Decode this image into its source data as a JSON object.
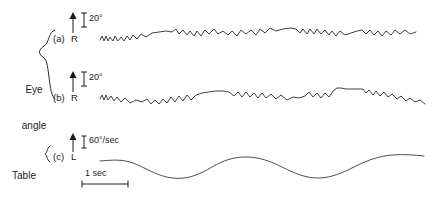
{
  "figure": {
    "background_color": "#ffffff",
    "ink_color": "#2b2b2b"
  },
  "groups": {
    "eye_angle_line1": "Eye",
    "eye_angle_line2": "angle",
    "table_velocity_line1": "Table",
    "table_velocity_line2": "velocity"
  },
  "traces": {
    "a": {
      "panel_label": "(a)",
      "direction_label": "R",
      "calibration_label": "20°"
    },
    "b": {
      "panel_label": "(b)",
      "direction_label": "R",
      "calibration_label": "20°"
    },
    "c": {
      "panel_label": "(c)",
      "direction_label": "L",
      "calibration_label": "60°/sec"
    }
  },
  "time_scale": {
    "label": "1 sec"
  },
  "chart_data": {
    "type": "line",
    "title": "",
    "xlabel": "",
    "ylabel": "",
    "grid": false,
    "legend": "none",
    "time_axis": {
      "scale_bar_label": "1 sec",
      "scale_bar_px": 46
    },
    "series": [
      {
        "name": "(a) Eye angle",
        "direction_positive": "R",
        "calibration": "20°",
        "units": "degrees",
        "waveform": "nystagmus-sawtooth",
        "path": "M 100,40 L 102,36 L 104,41 L 106,36 L 108,41 L 110,37 L 113,41 L 115,36 L 118,41 L 121,37 L 124,41 L 127,36 L 130,40 L 133,35 L 137,39 L 141,34 L 146,37 L 152,33 L 159,32 L 166,31 L 172,32 L 176,29 L 179,34 L 183,30 L 187,35 L 190,31 L 194,36 L 197,31 L 201,36 L 205,30 L 209,34 L 214,29 L 218,34 L 223,31 L 228,35 L 232,31 L 237,36 L 241,30 L 246,34 L 251,30 L 256,35 L 260,29 L 265,33 L 270,28 L 276,31 L 283,29 L 290,28 L 296,29 L 300,33 L 303,29 L 307,34 L 310,29 L 314,34 L 317,29 L 321,34 L 325,30 L 329,35 L 332,31 L 336,36 L 340,31 L 345,35 L 351,33 L 357,31 L 362,30 L 366,34 L 370,30 L 374,35 L 378,31 L 382,36 L 386,31 L 391,35 L 395,30 L 400,34 L 405,30 L 410,34 L 416,32"
      },
      {
        "name": "(b) Eye angle",
        "direction_positive": "R",
        "calibration": "20°",
        "units": "degrees",
        "waveform": "nystagmus-sawtooth",
        "path": "M 100,99 L 102,95 L 104,100 L 106,95 L 108,100 L 111,96 L 114,101 L 117,97 L 121,102 L 125,98 L 130,103 L 136,100 L 142,102 L 147,99 L 151,104 L 155,100 L 159,104 L 163,99 L 167,103 L 171,97 L 175,102 L 179,96 L 183,101 L 187,95 L 191,100 L 196,95 L 202,93 L 209,92 L 216,91 L 223,91 L 229,92 L 234,96 L 238,92 L 242,97 L 246,92 L 250,97 L 254,93 L 258,98 L 262,93 L 266,98 L 271,94 L 276,99 L 281,95 L 287,100 L 293,97 L 299,98 L 305,96 L 309,92 L 313,97 L 317,93 L 321,98 L 325,93 L 329,97 L 333,91 L 337,88 L 341,88 L 346,89 L 352,89 L 358,89 L 363,89 L 366,93 L 369,90 L 373,95 L 376,91 L 380,96 L 384,92 L 388,97 L 392,94 L 397,99 L 401,96 L 406,101 L 410,98 L 415,102 L 420,100 L 425,104"
      },
      {
        "name": "(c) Table velocity",
        "direction_positive": "L",
        "calibration": "60°/sec",
        "units": "degrees/sec",
        "waveform": "sinusoid",
        "cycles_visible": 2,
        "path": "M 100,161 C 112,160 122,159 133,163 C 146,168 157,176 172,178 C 188,180 200,174 212,167 C 224,160 234,157 246,157 C 259,157 270,161 282,167 C 294,173 305,178 318,178 C 332,178 344,172 356,166 C 368,160 380,156 392,155 C 404,154 414,155 424,156"
      }
    ]
  }
}
